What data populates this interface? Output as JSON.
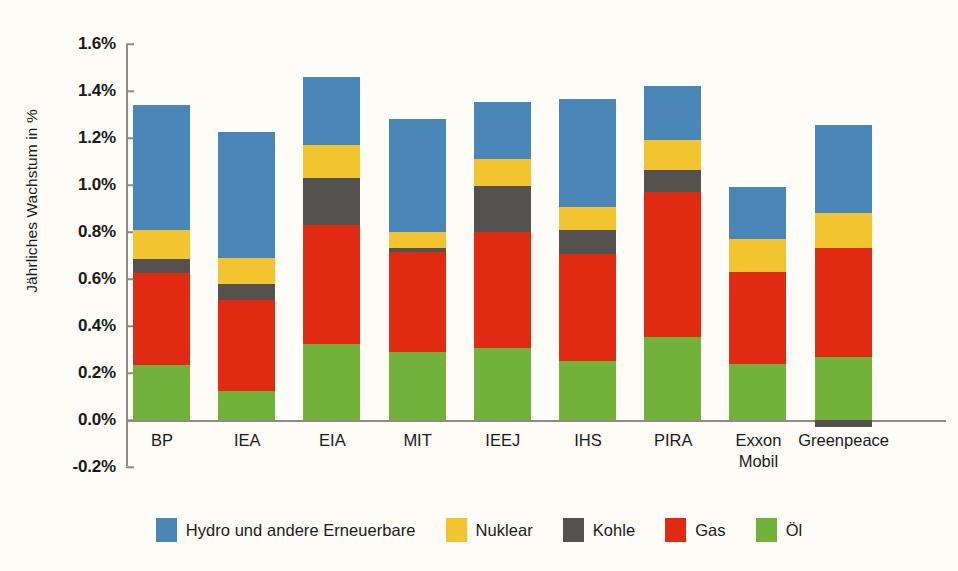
{
  "chart_data": {
    "type": "bar",
    "stacked": true,
    "title": "",
    "xlabel": "",
    "ylabel": "Jährliches Wachstum in %",
    "ylim": [
      -0.2,
      1.6
    ],
    "ytick_step": 0.2,
    "ytick_labels": [
      "1.6%",
      "1.4%",
      "1.2%",
      "1.0%",
      "0.8%",
      "0.6%",
      "0.4%",
      "0.2%",
      "0.0%",
      "-0.2%"
    ],
    "ytick_values": [
      1.6,
      1.4,
      1.2,
      1.0,
      0.8,
      0.6,
      0.4,
      0.2,
      0.0,
      -0.2
    ],
    "grid": false,
    "legend_position": "bottom",
    "categories": [
      "BP",
      "IEA",
      "EIA",
      "MIT",
      "IEEJ",
      "IHS",
      "PIRA",
      "Exxon\nMobil",
      "Greenpeace"
    ],
    "series": [
      {
        "name": "Öl",
        "color": "#72b23a",
        "values": [
          0.235,
          0.125,
          0.325,
          0.29,
          0.305,
          0.25,
          0.355,
          0.24,
          0.27
        ]
      },
      {
        "name": "Gas",
        "color": "#e02b12",
        "values": [
          0.39,
          0.385,
          0.505,
          0.425,
          0.495,
          0.455,
          0.615,
          0.39,
          0.46
        ]
      },
      {
        "name": "Kohle",
        "color": "#54524e",
        "values": [
          0.06,
          0.07,
          0.2,
          0.015,
          0.195,
          0.105,
          0.095,
          0.0,
          -0.03
        ]
      },
      {
        "name": "Nuklear",
        "color": "#f2c430",
        "values": [
          0.125,
          0.11,
          0.14,
          0.07,
          0.115,
          0.095,
          0.125,
          0.14,
          0.15
        ]
      },
      {
        "name": "Hydro und andere Erneuerbare",
        "color": "#4a87b8",
        "values": [
          0.53,
          0.535,
          0.29,
          0.48,
          0.245,
          0.46,
          0.23,
          0.22,
          0.375
        ]
      }
    ],
    "totals": [
      1.34,
      1.225,
      1.46,
      1.28,
      1.355,
      1.365,
      1.42,
      0.99,
      1.255
    ],
    "legend": [
      {
        "label": "Hydro und andere Erneuerbare",
        "color": "#4a87b8"
      },
      {
        "label": "Nuklear",
        "color": "#f2c430"
      },
      {
        "label": "Kohle",
        "color": "#54524e"
      },
      {
        "label": "Gas",
        "color": "#e02b12"
      },
      {
        "label": "Öl",
        "color": "#72b23a"
      }
    ]
  },
  "colors": {
    "background": "#fdfcf7",
    "axis": "#8d8c88",
    "text": "#1a1a1a",
    "hydro": "#4a87b8",
    "nuklear": "#f2c430",
    "kohle": "#54524e",
    "gas": "#e02b12",
    "oel": "#72b23a"
  }
}
